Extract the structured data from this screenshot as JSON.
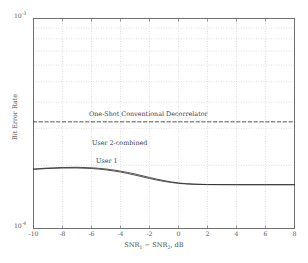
{
  "chart_data": {
    "type": "line",
    "title": "",
    "xlabel": "SNR₁ − SNR₂, dB",
    "ylabel": "Bit Error Rate",
    "xlabel_parts": {
      "a": "SNR",
      "a_sub": "1",
      "minus": " − ",
      "b": "SNR",
      "b_sub": "2",
      "units": ", dB"
    },
    "xscale": "linear",
    "yscale": "log",
    "xlim": [
      -10,
      8
    ],
    "ylim": [
      0.0001,
      0.001
    ],
    "xticks": [
      -10,
      -8,
      -6,
      -4,
      -2,
      0,
      2,
      4,
      6,
      8
    ],
    "xticklabels": [
      "-10",
      "-8",
      "-6",
      "-4",
      "-2",
      "0",
      "2",
      "4",
      "6",
      "8"
    ],
    "yticks": [
      0.0001,
      0.001
    ],
    "yticklabels": [
      "10",
      "10"
    ],
    "ytick_exponents": [
      "-4",
      "-3"
    ],
    "y_minor_ticks": [
      0.0002,
      0.0003,
      0.0004,
      0.0005,
      0.0006,
      0.0007,
      0.0008,
      0.0009
    ],
    "grid": true,
    "grid_style": "dotted",
    "legend": "none",
    "annotations": [
      {
        "text": "One-Shot Conventional Decorrelator",
        "x": -5.2,
        "y": 0.00029
      },
      {
        "text": "User 2-combined",
        "x": -4.9,
        "y": 0.000206
      },
      {
        "text": "User 1",
        "x": -4.5,
        "y": 0.000178
      }
    ],
    "series": [
      {
        "name": "One-Shot Conventional Decorrelator",
        "style": "dashed",
        "color": "#3a3a3a",
        "x": [
          -10,
          8
        ],
        "values": [
          0.000322,
          0.000322
        ]
      },
      {
        "name": "User 2-combined",
        "style": "solid",
        "color": "#2a2a2a",
        "x": [
          -10,
          -9,
          -8,
          -7,
          -6,
          -5,
          -4,
          -3,
          -2,
          -1,
          0,
          1,
          2,
          3,
          4,
          5,
          6,
          7,
          8
        ],
        "values": [
          0.000192,
          0.000194,
          0.0001952,
          0.0001956,
          0.0001946,
          0.000192,
          0.0001876,
          0.0001818,
          0.000175,
          0.000169,
          0.0001648,
          0.0001628,
          0.000162,
          0.0001618,
          0.0001617,
          0.0001617,
          0.0001617,
          0.0001617,
          0.0001617
        ]
      },
      {
        "name": "User 1",
        "style": "solid",
        "color": "#2a2a2a",
        "x": [
          -10,
          -9,
          -8,
          -7,
          -6,
          -5,
          -4,
          -3,
          -2,
          -1,
          0,
          1,
          2,
          3,
          4,
          5,
          6,
          7,
          8
        ],
        "values": [
          0.0001912,
          0.000193,
          0.000194,
          0.0001942,
          0.000193,
          0.0001902,
          0.0001856,
          0.0001796,
          0.000173,
          0.0001676,
          0.000164,
          0.0001624,
          0.0001618,
          0.0001617,
          0.0001616,
          0.0001616,
          0.0001616,
          0.0001616,
          0.0001616
        ]
      }
    ]
  },
  "axes": {
    "ytop_mantissa": "10",
    "ytop_exponent": "-3",
    "ybot_mantissa": "10",
    "ybot_exponent": "-4"
  }
}
